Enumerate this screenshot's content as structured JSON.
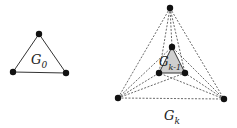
{
  "graphs": [
    {
      "id": "g0",
      "label": "G",
      "subscript": "0",
      "vertices": [
        [
          39,
          34
        ],
        [
          13,
          72
        ],
        [
          66,
          73
        ]
      ],
      "edges": [
        [
          0,
          1
        ],
        [
          1,
          2
        ],
        [
          2,
          0
        ]
      ],
      "edge_style": "solid"
    },
    {
      "id": "gk",
      "label": "G",
      "subscript": "k",
      "outer_vertices": [
        [
          170,
          8
        ],
        [
          118,
          98
        ],
        [
          224,
          99
        ]
      ],
      "inner_vertices": [
        [
          172,
          47
        ],
        [
          159,
          73
        ],
        [
          185,
          73
        ]
      ],
      "inner_label": "G",
      "inner_subscript": "k-1",
      "inner_fill": "#cfcfcf",
      "edge_style": "dashed"
    }
  ],
  "colors": {
    "stroke": "#333333",
    "vertex": "#111111"
  }
}
